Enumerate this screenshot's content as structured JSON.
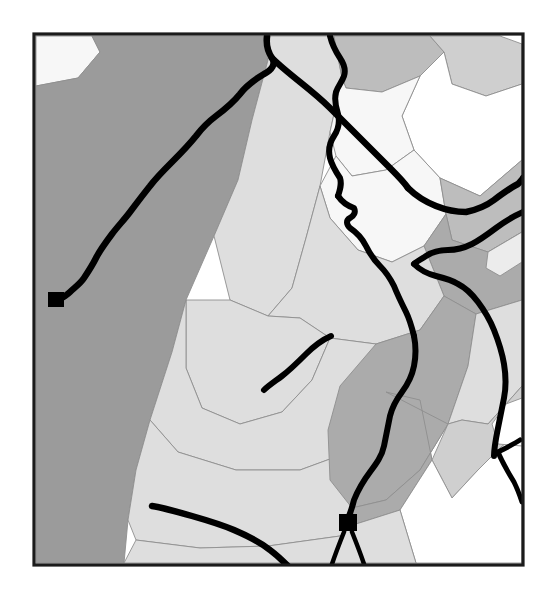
{
  "document": {
    "title": "Thematic Region Map",
    "background_color": "#ffffff",
    "frame": {
      "x": 34,
      "y": 34,
      "width": 489,
      "height": 531,
      "stroke_color": "#1b1b1b",
      "stroke_width": 3.2
    }
  },
  "legend_shades": {
    "white": "#ffffff",
    "near_white": "#f7f7f7",
    "very_light_gray": "#ececec",
    "light_gray": "#dedede",
    "light_mid_gray": "#cfcfcf",
    "mid_gray": "#bdbdbd",
    "medium_gray": "#ababab",
    "dark_gray": "#9b9b9b",
    "boundary_stroke": "#8f8f8f",
    "road_color": "#000000",
    "marker_color": "#000000"
  },
  "chart_data": {
    "type": "map",
    "projection": "planar",
    "viewbox": [
      0,
      0,
      556,
      589
    ],
    "clip_frame": [
      34,
      34,
      523,
      565
    ],
    "region_count": 22,
    "road_count": 12,
    "marker_count": 2,
    "grid": false,
    "legend": null,
    "regions": [
      {
        "id": "r01",
        "name": "northwest-white-wedge",
        "shade_key": "near_white",
        "fill": "#f7f7f7",
        "points": "36,36 92,36 100,52 78,78 36,86"
      },
      {
        "id": "r02",
        "name": "west-large-dark",
        "shade_key": "dark_gray",
        "fill": "#9b9b9b",
        "points": "36,86 78,78 100,52 92,36 270,36 268,60 252,120 238,180 214,236 186,300 172,352 150,420 136,470 128,520 124,563 36,563"
      },
      {
        "id": "r03",
        "name": "north-central-light",
        "shade_key": "light_gray",
        "fill": "#dedede",
        "points": "270,36 334,36 342,78 330,132 320,186 306,238 292,288 268,316 230,300 214,236 238,180 252,120 268,60"
      },
      {
        "id": "r04",
        "name": "north-ridge-mid",
        "shade_key": "mid_gray",
        "fill": "#bdbdbd",
        "points": "334,36 430,36 444,52 420,76 382,92 346,88 342,78"
      },
      {
        "id": "r05",
        "name": "northeast-light-band",
        "shade_key": "light_mid_gray",
        "fill": "#cfcfcf",
        "points": "430,36 500,36 522,44 522,84 486,96 452,84 444,52"
      },
      {
        "id": "r06",
        "name": "northeast-white-basin",
        "shade_key": "white",
        "fill": "#ffffff",
        "points": "444,52 452,84 486,96 522,84 522,160 480,196 440,178 414,150 402,116 420,76"
      },
      {
        "id": "r07",
        "name": "north-central-white",
        "shade_key": "near_white",
        "fill": "#f7f7f7",
        "points": "342,78 346,88 382,92 420,76 402,116 414,150 386,170 352,176 336,156 330,132"
      },
      {
        "id": "r08",
        "name": "central-white-valley",
        "shade_key": "near_white",
        "fill": "#f7f7f7",
        "points": "336,156 352,176 386,170 414,150 440,178 446,214 424,246 392,262 358,250 330,218 320,186"
      },
      {
        "id": "r09",
        "name": "east-upper-mid",
        "shade_key": "mid_gray",
        "fill": "#bdbdbd",
        "points": "440,178 480,196 522,160 522,232 488,252 452,240 446,214"
      },
      {
        "id": "r10",
        "name": "east-mid-gray",
        "shade_key": "medium_gray",
        "fill": "#ababab",
        "points": "446,214 452,240 488,252 522,232 522,300 476,314 444,296 424,246"
      },
      {
        "id": "r11",
        "name": "central-light-plain",
        "shade_key": "light_gray",
        "fill": "#dedede",
        "points": "292,288 306,238 320,186 330,218 358,250 392,262 424,246 444,296 420,330 376,344 330,338 300,318 268,316"
      },
      {
        "id": "r12",
        "name": "mid-central-light",
        "shade_key": "light_gray",
        "fill": "#dedede",
        "points": "230,300 268,316 300,318 330,338 312,380 282,412 240,424 202,408 186,368 186,300"
      },
      {
        "id": "r13",
        "name": "west-lower-light",
        "shade_key": "light_gray",
        "fill": "#dedede",
        "points": "172,352 186,300 186,368 202,408 240,424 282,412 312,380 330,338 376,344 386,392 360,448 300,470 236,470 178,452 150,420"
      },
      {
        "id": "r14",
        "name": "southwest-light",
        "shade_key": "light_gray",
        "fill": "#dedede",
        "points": "150,420 178,452 236,470 300,470 360,448 386,392 420,400 432,460 400,510 340,536 268,546 200,548 136,540 128,520 136,470"
      },
      {
        "id": "r15",
        "name": "south-central-dark",
        "shade_key": "medium_gray",
        "fill": "#ababab",
        "points": "376,344 420,330 444,296 476,314 468,366 448,424 420,470 386,500 352,508 330,480 328,430 340,386"
      },
      {
        "id": "r16",
        "name": "south-dark-lobe",
        "shade_key": "medium_gray",
        "fill": "#ababab",
        "points": "386,392 420,400 432,460 400,510 356,524 352,508 386,500 420,470 448,424"
      },
      {
        "id": "r17",
        "name": "east-lower-light",
        "shade_key": "light_gray",
        "fill": "#dedede",
        "points": "476,314 522,300 522,386 506,404 488,424 462,420 448,424 468,366"
      },
      {
        "id": "r18",
        "name": "southeast-mid",
        "shade_key": "light_mid_gray",
        "fill": "#cfcfcf",
        "points": "448,424 462,420 488,424 506,404 522,386 522,430 500,448 478,470 452,498 432,460"
      },
      {
        "id": "r19",
        "name": "southeast-white-corner",
        "shade_key": "white",
        "fill": "#ffffff",
        "points": "432,460 452,498 478,470 500,448 522,430 522,563 416,563 400,510"
      },
      {
        "id": "r20",
        "name": "south-edge-light",
        "shade_key": "light_gray",
        "fill": "#dedede",
        "points": "136,540 200,548 268,546 340,536 356,524 400,510 416,563 124,563"
      },
      {
        "id": "r21",
        "name": "right-edge-notch",
        "shade_key": "white",
        "fill": "#ffffff",
        "points": "506,404 522,398 522,446 498,444 492,424"
      },
      {
        "id": "r22",
        "name": "east-small-light",
        "shade_key": "very_light_gray",
        "fill": "#ececec",
        "points": "488,252 522,232 522,262 500,276 486,268"
      }
    ],
    "roads": [
      {
        "id": "road-main-river",
        "name": "main-river-northwest",
        "width": 6.5,
        "path": "M 267,36 C 266,44 268,52 272,58 C 276,64 272,70 264,74 C 254,80 246,86 240,94 C 232,104 224,110 216,116 C 208,122 202,128 196,136 C 188,146 180,154 172,162 C 164,170 156,178 150,186 C 142,196 136,204 130,212 C 124,220 118,226 112,234 C 106,242 100,250 96,258 C 92,266 88,272 84,278 C 80,284 74,288 70,292 C 66,296 62,298 58,300"
      },
      {
        "id": "road-north-branch",
        "name": "north-branch-east",
        "width": 6.0,
        "path": "M 330,36 C 332,44 336,52 340,58 C 344,64 346,70 344,76 C 342,82 338,86 336,92 C 334,100 336,108 338,114 C 340,122 338,130 334,136 C 330,142 328,150 330,158 C 332,166 336,172 340,178 C 342,184 340,190 338,196"
      },
      {
        "id": "road-center-descend",
        "name": "center-descending-river",
        "width": 6.0,
        "path": "M 338,196 C 342,202 348,206 354,208 C 356,212 354,216 350,218 C 346,220 346,224 350,228 C 356,232 362,238 366,246 C 370,254 374,260 380,266 C 386,272 390,278 394,286 C 398,296 402,304 406,312 C 410,320 412,328 414,336"
      },
      {
        "id": "road-to-junction",
        "name": "junction-approach-south",
        "width": 6.0,
        "path": "M 414,336 C 416,346 416,356 414,366 C 412,376 408,384 402,392 C 396,400 392,408 390,416 C 388,426 386,436 384,446 C 382,456 376,464 370,472 C 364,480 358,490 354,500 C 352,508 350,514 348,518"
      },
      {
        "id": "road-north-to-junction",
        "name": "north-diagonal-to-junction",
        "width": 6.5,
        "path": "M 272,58 C 280,66 290,74 300,82 C 310,90 320,98 330,108 C 340,118 350,128 360,138 C 370,148 380,158 390,168 C 398,176 404,182 408,188"
      },
      {
        "id": "road-east-sweep",
        "name": "east-sweeping-road",
        "width": 6.5,
        "path": "M 408,188 C 416,196 426,202 436,206 C 446,210 456,212 466,212 C 476,210 486,206 494,200 C 502,194 510,188 518,184 C 520,182 522,180 523,178"
      },
      {
        "id": "road-northeast-exit",
        "name": "northeast-edge-road",
        "width": 6.0,
        "path": "M 523,212 C 514,216 504,222 496,228 C 488,234 480,240 472,244 C 464,248 456,250 448,250 C 440,250 432,252 426,256 C 420,260 416,262 414,264"
      },
      {
        "id": "road-junction-east",
        "name": "junction-east-spur",
        "width": 6.0,
        "path": "M 414,264 C 420,270 428,274 436,276 C 444,278 452,280 458,284 C 466,288 472,294 478,302 C 484,310 490,320 494,330 C 498,340 502,352 504,364 C 506,376 506,388 504,398 C 502,408 500,418 498,428 C 496,438 494,448 494,456"
      },
      {
        "id": "road-east-fork-a",
        "name": "east-fork-lower-left",
        "width": 5.0,
        "path": "M 498,452 C 502,462 508,472 514,482 C 518,490 520,496 522,502"
      },
      {
        "id": "road-east-fork-b",
        "name": "east-fork-upper-right",
        "width": 5.0,
        "path": "M 498,452 C 506,448 514,444 520,440"
      },
      {
        "id": "road-mid-stub",
        "name": "mid-central-stub-river",
        "width": 6.0,
        "path": "M 331,336 C 322,340 314,346 306,354 C 298,362 290,370 282,376 C 274,382 268,386 264,390"
      },
      {
        "id": "road-south-long",
        "name": "southwest-long-road",
        "width": 6.5,
        "path": "M 152,506 C 164,508 178,512 192,516 C 206,520 220,524 234,530 C 248,536 260,542 270,550 C 278,556 284,562 288,566"
      },
      {
        "id": "road-marker-leg-left",
        "name": "marker-south-leg-left",
        "width": 4.5,
        "path": "M 344,532 C 340,542 336,552 332,564"
      },
      {
        "id": "road-marker-leg-right",
        "name": "marker-south-leg-right",
        "width": 4.5,
        "path": "M 352,532 C 356,542 360,552 364,564"
      }
    ],
    "markers": [
      {
        "id": "marker-west",
        "name": "city-marker-west",
        "label": "",
        "x": 48,
        "y": 292,
        "width": 16,
        "height": 15
      },
      {
        "id": "marker-south",
        "name": "city-marker-south",
        "label": "",
        "x": 339,
        "y": 514,
        "width": 18,
        "height": 17
      }
    ]
  }
}
